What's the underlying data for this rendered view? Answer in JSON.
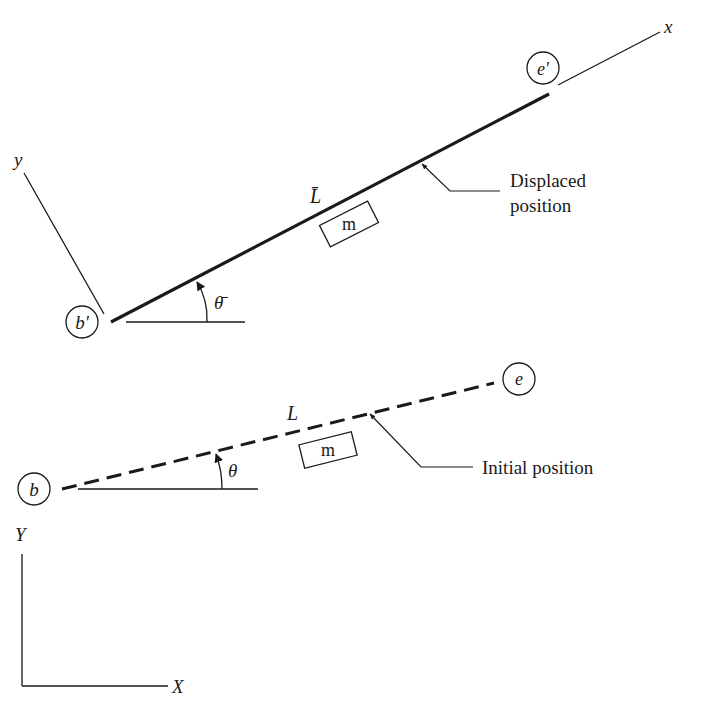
{
  "diagram": {
    "type": "rigid bar displacement schematic",
    "colors": {
      "ink": "#1a1a1a",
      "background": "#ffffff"
    },
    "displaced": {
      "start_node": "b′",
      "end_node": "e′",
      "length_label": "L̄",
      "angle_label": "θ̄",
      "mass_label": "m",
      "callout": {
        "line1": "Displaced",
        "line2": "position"
      },
      "local_axes": {
        "x": "x",
        "y": "y"
      }
    },
    "initial": {
      "start_node": "b",
      "end_node": "e",
      "length_label": "L",
      "angle_label": "θ",
      "mass_label": "m",
      "callout": "Initial position"
    },
    "global_axes": {
      "X": "X",
      "Y": "Y"
    }
  }
}
